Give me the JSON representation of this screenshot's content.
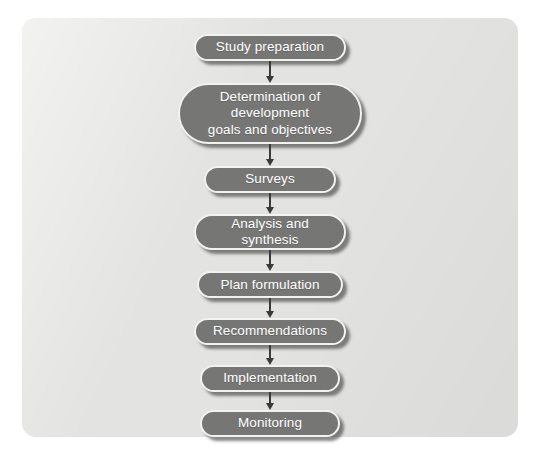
{
  "figure": {
    "kind": "flowchart",
    "orientation": "vertical",
    "panel_color": "#e3e3e1",
    "node_fill_color": "#767674",
    "node_border_color": "#f2f2f0",
    "node_text_color": "#ffffff",
    "arrow_color": "#3a3a3a",
    "background_color": "#ffffff"
  },
  "nodes": [
    {
      "id": "study-preparation",
      "label": "Study preparation"
    },
    {
      "id": "determination-goals",
      "label": "Determination of development\ngoals and objectives"
    },
    {
      "id": "surveys",
      "label": "Surveys"
    },
    {
      "id": "analysis-synthesis",
      "label": "Analysis and synthesis"
    },
    {
      "id": "plan-formulation",
      "label": "Plan formulation"
    },
    {
      "id": "recommendations",
      "label": "Recommendations"
    },
    {
      "id": "implementation",
      "label": "Implementation"
    },
    {
      "id": "monitoring",
      "label": "Monitoring"
    }
  ],
  "edges": [
    {
      "from": "study-preparation",
      "to": "determination-goals",
      "marker": "arrow-down"
    },
    {
      "from": "determination-goals",
      "to": "surveys",
      "marker": "arrow-down"
    },
    {
      "from": "surveys",
      "to": "analysis-synthesis",
      "marker": "arrow-down"
    },
    {
      "from": "analysis-synthesis",
      "to": "plan-formulation",
      "marker": "arrow-down"
    },
    {
      "from": "plan-formulation",
      "to": "recommendations",
      "marker": "arrow-down"
    },
    {
      "from": "recommendations",
      "to": "implementation",
      "marker": "arrow-down"
    },
    {
      "from": "implementation",
      "to": "monitoring",
      "marker": "arrow-down"
    }
  ]
}
